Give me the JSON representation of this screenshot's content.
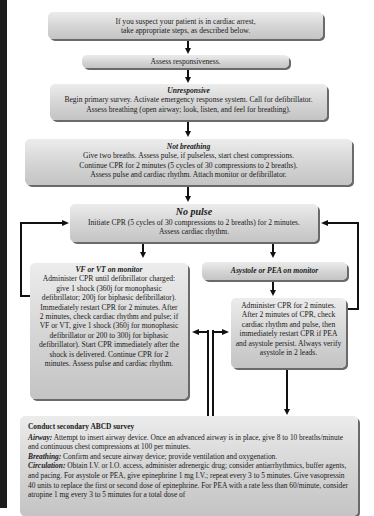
{
  "flowchart": {
    "intro": {
      "line1": "If you suspect your patient is in cardiac arrest,",
      "line2": "take appropriate steps, as described below."
    },
    "assess": {
      "text": "Assess responsiveness."
    },
    "unresponsive": {
      "heading": "Unresponsive",
      "line1": "Begin primary survey. Activate emergency response system. Call for defibrillator.",
      "line2": "Assess breathing (open airway; look, listen, and feel for breathing)."
    },
    "not_breathing": {
      "heading": "Not breathing",
      "line1": "Give two breaths. Assess pulse, if pulseless, start chest compressions.",
      "line2": "Continue CPR for 2 minutes (5 cycles of 30 compressions to 2 breaths).",
      "line3": "Assess pulse and cardiac rhythm. Attach monitor or defibrillator."
    },
    "no_pulse": {
      "heading": "No pulse",
      "line1": "Initiate CPR (5 cycles of 30 compressions to 2 breaths) for 2 minutes.",
      "line2": "Assess cardiac rhythm."
    },
    "vf_vt": {
      "heading": "VF or VT on monitor",
      "body": "Administer CPR until defibrillator charged: give 1 shock (360j for monophasic defibrillator; 200j for biphasic defibrillator). Immediately restart CPR for 2 minutes. After 2 minutes, check cardiac rhythm and pulse; if VF or VT, give 1 shock (360j for monophasic defibrillator or 200 to 300j for biphasic defibrillator). Start CPR immediately after the shock is delivered. Continue CPR for 2 minutes. Assess pulse and cardiac rhythm."
    },
    "asystole_pea": {
      "heading": "Asystole or PEA on monitor"
    },
    "asystole_action": {
      "body": "Administer CPR for 2 minutes. After 2 minutes of CPR, check cardiac rhythm and pulse, then immediately restart CPR if PEA and asystole persist. Always verify asystole in 2 leads."
    },
    "secondary": {
      "title": "Conduct secondary ABCD survey",
      "airway_label": "Airway:",
      "airway_text": " Attempt to insert airway device. Once an advanced airway is in place, give 8 to 10 breaths/minute and continuous chest compressions at 100 per minutes.",
      "breathing_label": "Breathing:",
      "breathing_text": " Confirm and secure airway device; provide ventilation and oxygenation.",
      "circulation_label": "Circulation:",
      "circulation_text": " Obtain I.V. or I.O. access, administer adrenergic drug; consider antiarrhythmics, buffer agents, and pacing. For asystole or PEA, give epinephrine 1 mg I.V.; repeat every 3 to 5 minutes. Give vasopressin 40 units to replace the first or second dose of epinephrine.  For PEA with a rate less than 60/minute, consider atropine 1 mg every 3 to 5 minutes for a total dose of"
    }
  }
}
